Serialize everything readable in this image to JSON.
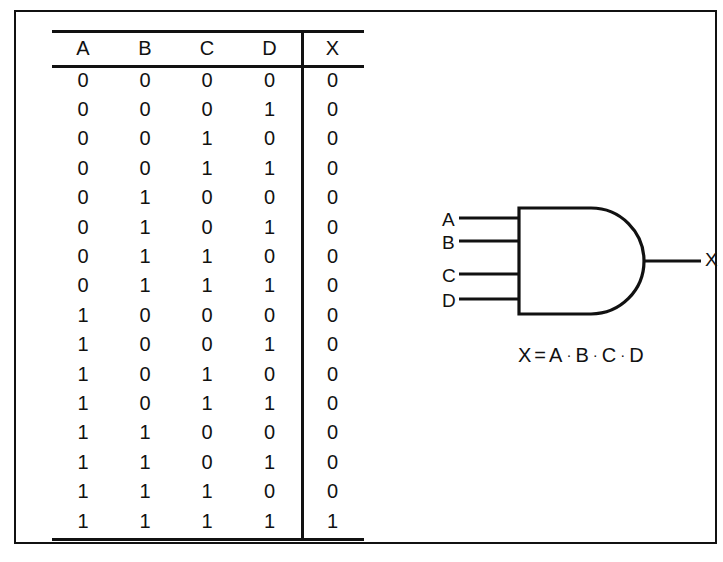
{
  "table": {
    "headers": [
      "A",
      "B",
      "C",
      "D",
      "X"
    ],
    "rows": [
      [
        "0",
        "0",
        "0",
        "0",
        "0"
      ],
      [
        "0",
        "0",
        "0",
        "1",
        "0"
      ],
      [
        "0",
        "0",
        "1",
        "0",
        "0"
      ],
      [
        "0",
        "0",
        "1",
        "1",
        "0"
      ],
      [
        "0",
        "1",
        "0",
        "0",
        "0"
      ],
      [
        "0",
        "1",
        "0",
        "1",
        "0"
      ],
      [
        "0",
        "1",
        "1",
        "0",
        "0"
      ],
      [
        "0",
        "1",
        "1",
        "1",
        "0"
      ],
      [
        "1",
        "0",
        "0",
        "0",
        "0"
      ],
      [
        "1",
        "0",
        "0",
        "1",
        "0"
      ],
      [
        "1",
        "0",
        "1",
        "0",
        "0"
      ],
      [
        "1",
        "0",
        "1",
        "1",
        "0"
      ],
      [
        "1",
        "1",
        "0",
        "0",
        "0"
      ],
      [
        "1",
        "1",
        "0",
        "1",
        "0"
      ],
      [
        "1",
        "1",
        "1",
        "0",
        "0"
      ],
      [
        "1",
        "1",
        "1",
        "1",
        "1"
      ]
    ]
  },
  "gate": {
    "type": "and-gate",
    "inputs": [
      "A",
      "B",
      "C",
      "D"
    ],
    "output": "X",
    "equation": {
      "lhs": "X",
      "equals": "=",
      "operands": [
        "A",
        "B",
        "C",
        "D"
      ],
      "operator": "·",
      "full": "X = A · B · C · D"
    }
  },
  "colors": {
    "ink": "#111111",
    "paper": "#ffffff"
  }
}
